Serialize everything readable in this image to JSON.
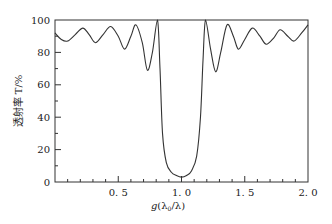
{
  "chart_data": {
    "type": "line",
    "title": "",
    "xlabel": "g(λ0/λ)",
    "ylabel": "透射率 T/%",
    "xlim": [
      0,
      2.0
    ],
    "ylim": [
      0,
      100
    ],
    "x_ticks": [
      "0.5",
      "1.0",
      "1.5",
      "2.0"
    ],
    "y_ticks": [
      "0",
      "20",
      "40",
      "60",
      "80",
      "100"
    ],
    "grid": false,
    "legend": null,
    "series": [
      {
        "name": "transmittance",
        "x": [
          0.0,
          0.05,
          0.1,
          0.16,
          0.22,
          0.27,
          0.32,
          0.38,
          0.44,
          0.5,
          0.55,
          0.6,
          0.64,
          0.69,
          0.73,
          0.77,
          0.81,
          0.83,
          0.85,
          0.88,
          0.92,
          0.96,
          1.0,
          1.04,
          1.08,
          1.12,
          1.15,
          1.17,
          1.19,
          1.23,
          1.27,
          1.31,
          1.36,
          1.41,
          1.45,
          1.5,
          1.56,
          1.62,
          1.67,
          1.73,
          1.78,
          1.84,
          1.89,
          1.95,
          2.0
        ],
        "values": [
          92,
          88,
          87,
          91,
          95,
          91,
          86,
          91,
          96,
          90,
          82,
          90,
          97,
          86,
          69,
          80,
          100,
          70,
          30,
          12,
          6,
          4,
          3,
          4,
          7,
          16,
          40,
          75,
          100,
          82,
          68,
          80,
          97,
          90,
          82,
          88,
          95,
          90,
          85,
          89,
          94,
          90,
          87,
          92,
          97
        ]
      }
    ]
  },
  "axes": {
    "xlabel_main": "g",
    "xlabel_paren": "(λ",
    "xlabel_sub": "0",
    "xlabel_rest": "/λ)",
    "ylabel": "透射率 T/%"
  }
}
